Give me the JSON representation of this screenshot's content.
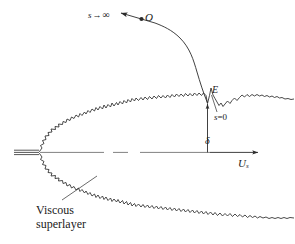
{
  "figure": {
    "background_color": "#ffffff",
    "line_color": "#2b2b2b",
    "text_color": "#1a1a1a",
    "width": 294,
    "height": 244
  },
  "labels": {
    "s_infinity": {
      "variable": "s",
      "arrow": "→",
      "limit": "∞",
      "full": "s → ∞"
    },
    "origin_point": "O",
    "interface_point": "E",
    "s_zero": {
      "variable": "s",
      "equals": "=",
      "value": "0",
      "full": "s=0"
    },
    "delta": "δ",
    "free_stream_velocity": {
      "symbol": "U",
      "subscript": "s",
      "full": "Uₛ"
    },
    "viscous_superlayer": {
      "line1": "Viscous",
      "line2": "superlayer"
    }
  },
  "elements": {
    "centerline_name": "jet-axis-dash-dot-line",
    "nozzle_name": "nozzle-lip-lines",
    "upper_interface_name": "upper-turbulent-interface",
    "lower_interface_name": "lower-turbulent-interface",
    "trajectory_name": "particle-trajectory-curve",
    "delta_arrow_name": "delta-dimension-arrow",
    "velocity_arrow_name": "free-stream-velocity-arrow",
    "leader_name": "viscous-superlayer-leader-line"
  }
}
